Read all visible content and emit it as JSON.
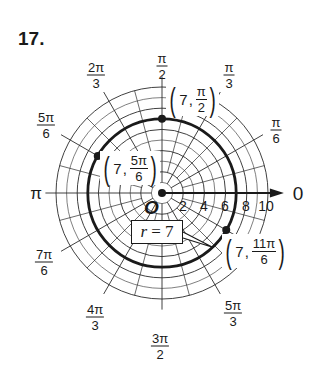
{
  "problem": {
    "number": "17."
  },
  "graph": {
    "center": [
      162,
      193
    ],
    "px_per_unit": 10.6,
    "grid_circle_radii": [
      1,
      2,
      3,
      4,
      5,
      6,
      7,
      8,
      9,
      10
    ],
    "radial_major_step_deg": 30,
    "radial_minor_step_deg": 15,
    "radial_minor_start_r": 2,
    "radial_major_extent_r": 11,
    "polar_axis_arrow_end_r": 11.5,
    "curve": {
      "type": "circle",
      "r": 7,
      "equation_label": "r = 7",
      "equation_var": "r",
      "equation_value": "7"
    },
    "origin_label": "O",
    "polar_axis_label": "0",
    "tick_labels": [
      "2",
      "4",
      "6",
      "8",
      "10"
    ],
    "angle_labels": [
      {
        "id": "pi-over-2",
        "num": "π",
        "den": "2"
      },
      {
        "id": "pi-over-3",
        "num": "π",
        "den": "3"
      },
      {
        "id": "pi-over-6",
        "num": "π",
        "den": "6"
      },
      {
        "id": "2pi-over-3",
        "num": "2π",
        "den": "3"
      },
      {
        "id": "5pi-over-6",
        "num": "5π",
        "den": "6"
      },
      {
        "id": "pi",
        "text": "π"
      },
      {
        "id": "7pi-over-6",
        "num": "7π",
        "den": "6"
      },
      {
        "id": "4pi-over-3",
        "num": "4π",
        "den": "3"
      },
      {
        "id": "3pi-over-2",
        "num": "3π",
        "den": "2"
      },
      {
        "id": "5pi-over-3",
        "num": "5π",
        "den": "3"
      }
    ],
    "points": [
      {
        "id": "p1",
        "r": "7",
        "theta_num": "π",
        "theta_den": "2",
        "theta_deg": 90
      },
      {
        "id": "p2",
        "r": "7",
        "theta_num": "5π",
        "theta_den": "6",
        "theta_deg": 150
      },
      {
        "id": "p3",
        "r": "7",
        "theta_num": "11π",
        "theta_den": "6",
        "theta_deg": 330
      }
    ],
    "colors": {
      "ink": "#1a1a1a",
      "grid": "#2a2a2a",
      "background": "#ffffff"
    }
  }
}
